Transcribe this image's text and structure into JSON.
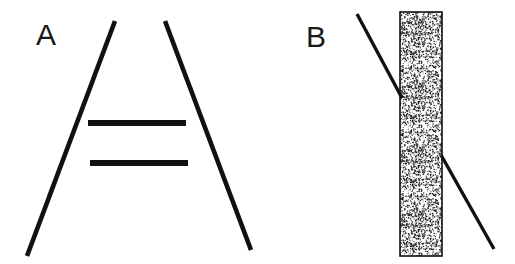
{
  "figure": {
    "width": 515,
    "height": 264,
    "background_color": "#ffffff",
    "ink_color": "#111111",
    "panels": [
      {
        "id": "panel-a",
        "label": "A",
        "illusion_name": "Ponzo illusion",
        "elements": {
          "converging_lines": [
            {
              "name": "left-converging-line",
              "x1": 115,
              "y1": 21,
              "x2": 27,
              "y2": 256,
              "stroke_width": 4.6
            },
            {
              "name": "right-converging-line",
              "x1": 165,
              "y1": 21,
              "x2": 251,
              "y2": 250,
              "stroke_width": 4.6
            }
          ],
          "horizontal_bars": [
            {
              "name": "upper-horizontal-bar",
              "x1": 88,
              "y1": 123,
              "x2": 186,
              "y2": 123,
              "stroke_width": 6
            },
            {
              "name": "lower-horizontal-bar",
              "x1": 90,
              "y1": 163,
              "x2": 188,
              "y2": 163,
              "stroke_width": 6
            }
          ]
        }
      },
      {
        "id": "panel-b",
        "label": "B",
        "illusion_name": "Poggendorff illusion",
        "elements": {
          "occluding_bar": {
            "name": "stippled-vertical-bar",
            "x": 400,
            "y": 12,
            "width": 42,
            "height": 244,
            "fill_pattern": "stipple",
            "fill_tone": "#9a9a9a",
            "border_color": "#111111"
          },
          "diagonal_segments": [
            {
              "name": "upper-diagonal-segment",
              "x1": 357,
              "y1": 14,
              "x2": 402,
              "y2": 98,
              "stroke_width": 3.4
            },
            {
              "name": "lower-diagonal-segment",
              "x1": 441,
              "y1": 155,
              "x2": 494,
              "y2": 249,
              "stroke_width": 3.4
            }
          ]
        }
      }
    ]
  }
}
